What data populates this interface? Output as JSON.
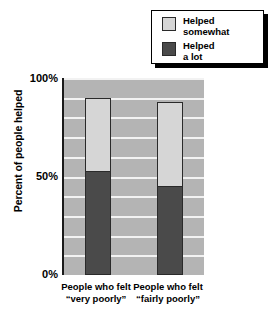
{
  "chart_data": {
    "type": "bar",
    "subtype": "stacked",
    "title": "",
    "xlabel": "",
    "ylabel": "Percent of people helped",
    "ylim": [
      0,
      100
    ],
    "ytick_labels": [
      "0%",
      "50%",
      "100%"
    ],
    "ytick_values": [
      0,
      50,
      100
    ],
    "grid": true,
    "grid_interval": 10,
    "legend_position": "top-right",
    "categories": [
      "People\nwho felt\n“very poorly”",
      "People\nwho felt\n“fairly poorly”"
    ],
    "series": [
      {
        "name": "Helped\na lot",
        "values": [
          53,
          45
        ],
        "color": "#4a4a4a"
      },
      {
        "name": "Helped\nsomewhat",
        "values": [
          37,
          43
        ],
        "color": "#d6d6d6"
      }
    ],
    "totals": [
      90,
      88
    ]
  },
  "title_remnant": "",
  "axes": {
    "y_title": "Percent of people helped",
    "y_ticks": [
      {
        "label": "100%",
        "value": 100
      },
      {
        "label": "50%",
        "value": 50
      },
      {
        "label": "0%",
        "value": 0
      }
    ],
    "x_labels": [
      "People\nwho felt\n“very poorly”",
      "People\nwho felt\n“fairly poorly”"
    ]
  },
  "legend": {
    "items": [
      {
        "label": "Helped\nsomewhat",
        "swatch": "light",
        "color": "#d6d6d6"
      },
      {
        "label": "Helped\na lot",
        "swatch": "dark",
        "color": "#4a4a4a"
      }
    ]
  },
  "colors": {
    "plot_background": "#b4b4b4",
    "gridline": "#f2f2f2",
    "helped_somewhat": "#d6d6d6",
    "helped_a_lot": "#4a4a4a",
    "axis": "#1a1a1a",
    "page_background": "#ffffff"
  }
}
